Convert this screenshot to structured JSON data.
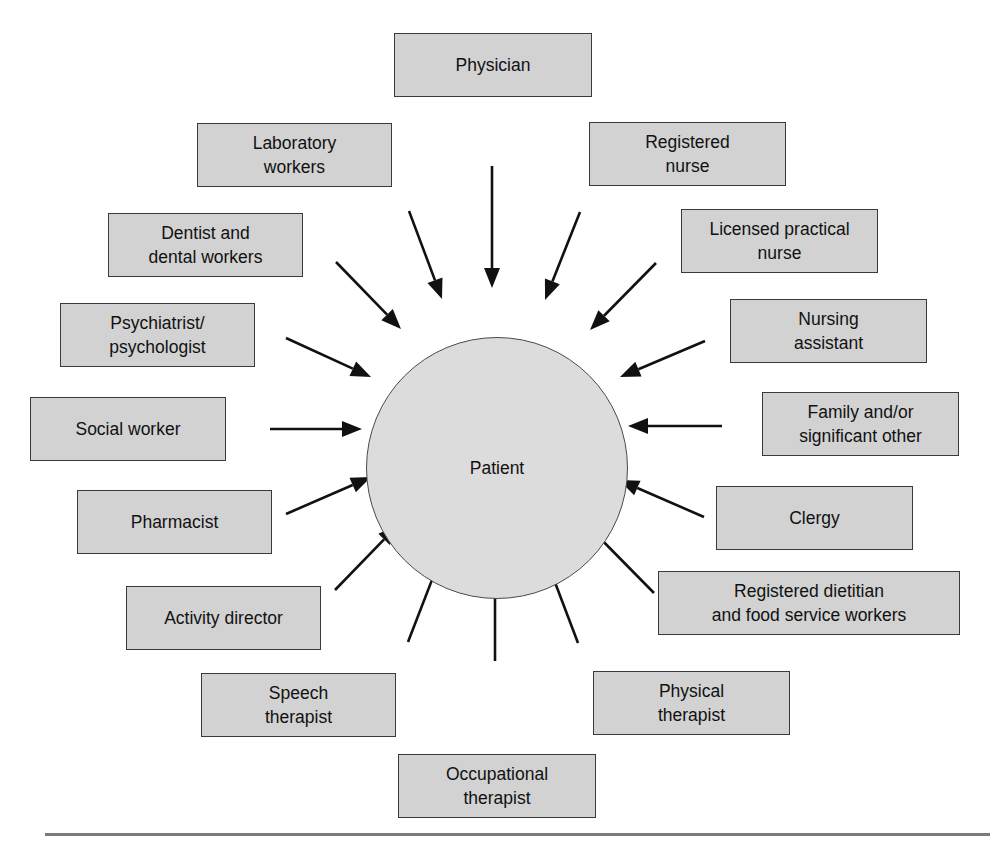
{
  "diagram": {
    "center": {
      "label": "Patient"
    },
    "colors": {
      "box_fill": "#d2d2d2",
      "box_border": "#3a3a3a",
      "circle_fill": "#dcdcdc",
      "arrow": "#111111"
    },
    "nodes": [
      {
        "id": "physician",
        "label": "Physician",
        "box": [
          394,
          33,
          198,
          64
        ]
      },
      {
        "id": "registered-nurse",
        "label": "Registered\nnurse",
        "box": [
          589,
          122,
          197,
          64
        ]
      },
      {
        "id": "licensed-practical-nurse",
        "label": "Licensed practical\nnurse",
        "box": [
          681,
          209,
          197,
          64
        ]
      },
      {
        "id": "nursing-assistant",
        "label": "Nursing\nassistant",
        "box": [
          730,
          299,
          197,
          64
        ]
      },
      {
        "id": "family-significant-other",
        "label": "Family and/or\nsignificant other",
        "box": [
          762,
          392,
          197,
          64
        ]
      },
      {
        "id": "clergy",
        "label": "Clergy",
        "box": [
          716,
          486,
          197,
          64
        ]
      },
      {
        "id": "registered-dietitian",
        "label": "Registered dietitian\nand food service workers",
        "box": [
          658,
          571,
          302,
          64
        ]
      },
      {
        "id": "physical-therapist",
        "label": "Physical\ntherapist",
        "box": [
          593,
          671,
          197,
          64
        ]
      },
      {
        "id": "occupational-therapist",
        "label": "Occupational\ntherapist",
        "box": [
          398,
          754,
          198,
          64
        ]
      },
      {
        "id": "speech-therapist",
        "label": "Speech\ntherapist",
        "box": [
          201,
          673,
          195,
          64
        ]
      },
      {
        "id": "activity-director",
        "label": "Activity director",
        "box": [
          126,
          586,
          195,
          64
        ]
      },
      {
        "id": "pharmacist",
        "label": "Pharmacist",
        "box": [
          77,
          490,
          195,
          64
        ]
      },
      {
        "id": "social-worker",
        "label": "Social worker",
        "box": [
          30,
          397,
          196,
          64
        ]
      },
      {
        "id": "psychiatrist-psychologist",
        "label": "Psychiatrist/\npsychologist",
        "box": [
          60,
          303,
          195,
          64
        ]
      },
      {
        "id": "dentist-dental-workers",
        "label": "Dentist and\ndental workers",
        "box": [
          108,
          213,
          195,
          64
        ]
      },
      {
        "id": "laboratory-workers",
        "label": "Laboratory\nworkers",
        "box": [
          197,
          123,
          195,
          64
        ]
      }
    ],
    "arrows": [
      {
        "from": "physician",
        "x1": 492,
        "y1": 166,
        "x2": 492,
        "y2": 288
      },
      {
        "from": "registered-nurse",
        "x1": 580,
        "y1": 212,
        "x2": 545,
        "y2": 300
      },
      {
        "from": "licensed-practical-nurse",
        "x1": 656,
        "y1": 263,
        "x2": 590,
        "y2": 330
      },
      {
        "from": "nursing-assistant",
        "x1": 705,
        "y1": 341,
        "x2": 620,
        "y2": 377
      },
      {
        "from": "family-significant-other",
        "x1": 722,
        "y1": 426,
        "x2": 628,
        "y2": 426
      },
      {
        "from": "clergy",
        "x1": 704,
        "y1": 517,
        "x2": 619,
        "y2": 480
      },
      {
        "from": "registered-dietitian",
        "x1": 654,
        "y1": 593,
        "x2": 589,
        "y2": 527
      },
      {
        "from": "physical-therapist",
        "x1": 578,
        "y1": 643,
        "x2": 545,
        "y2": 556
      },
      {
        "from": "occupational-therapist",
        "x1": 495,
        "y1": 661,
        "x2": 495,
        "y2": 568
      },
      {
        "from": "speech-therapist",
        "x1": 408,
        "y1": 642,
        "x2": 442,
        "y2": 554
      },
      {
        "from": "activity-director",
        "x1": 335,
        "y1": 590,
        "x2": 398,
        "y2": 525
      },
      {
        "from": "pharmacist",
        "x1": 286,
        "y1": 514,
        "x2": 371,
        "y2": 477
      },
      {
        "from": "social-worker",
        "x1": 270,
        "y1": 429,
        "x2": 362,
        "y2": 429
      },
      {
        "from": "psychiatrist-psychologist",
        "x1": 286,
        "y1": 338,
        "x2": 371,
        "y2": 377
      },
      {
        "from": "dentist-dental-workers",
        "x1": 336,
        "y1": 262,
        "x2": 401,
        "y2": 329
      },
      {
        "from": "laboratory-workers",
        "x1": 409,
        "y1": 211,
        "x2": 442,
        "y2": 299
      }
    ]
  }
}
